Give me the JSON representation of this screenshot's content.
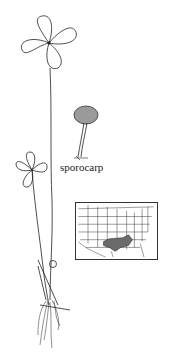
{
  "figure": {
    "labels": {
      "sporocarp": "sporocarp"
    },
    "map": {
      "region": "United States",
      "highlighted_range": "south-central US (Texas, Oklahoma, Arkansas, Louisiana)",
      "range_fill": "#6b6b6b"
    },
    "colors": {
      "ink": "#222222",
      "background": "#ffffff"
    }
  }
}
